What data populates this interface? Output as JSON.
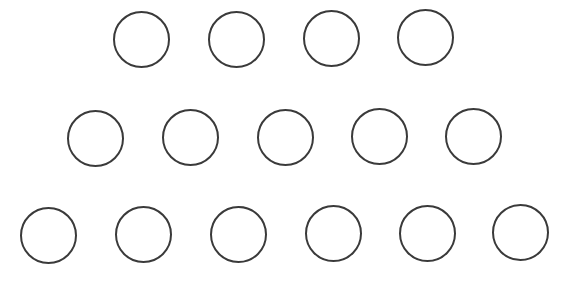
{
  "diagram": {
    "title": "",
    "background": "#ffffff",
    "stroke_color": "#3a3a3a",
    "stroke_width": 2,
    "radius": 28.5,
    "rows": [
      {
        "name": "row-1",
        "count": 4,
        "circles": [
          {
            "cx": 141,
            "cy": 39
          },
          {
            "cx": 236,
            "cy": 39
          },
          {
            "cx": 331,
            "cy": 38
          },
          {
            "cx": 425,
            "cy": 37
          }
        ]
      },
      {
        "name": "row-2",
        "count": 5,
        "circles": [
          {
            "cx": 95,
            "cy": 138
          },
          {
            "cx": 190,
            "cy": 137
          },
          {
            "cx": 285,
            "cy": 137
          },
          {
            "cx": 379,
            "cy": 136
          },
          {
            "cx": 473,
            "cy": 136
          }
        ]
      },
      {
        "name": "row-3",
        "count": 6,
        "circles": [
          {
            "cx": 48,
            "cy": 235
          },
          {
            "cx": 143,
            "cy": 234
          },
          {
            "cx": 238,
            "cy": 234
          },
          {
            "cx": 333,
            "cy": 233
          },
          {
            "cx": 427,
            "cy": 233
          },
          {
            "cx": 520,
            "cy": 232
          }
        ]
      }
    ],
    "total_circles": 15
  }
}
